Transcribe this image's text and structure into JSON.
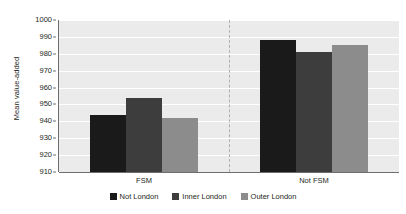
{
  "chart_data": {
    "type": "bar",
    "title": "",
    "subtitle": "",
    "xlabel": "",
    "ylabel": "Mean value-added",
    "categories": [
      "FSM",
      "Not FSM"
    ],
    "series": [
      {
        "name": "Not London",
        "color": "#1a1a1a",
        "values": [
          944,
          988
        ]
      },
      {
        "name": "Inner London",
        "color": "#3d3d3d",
        "values": [
          954,
          981
        ]
      },
      {
        "name": "Outer London",
        "color": "#8c8c8c",
        "values": [
          942,
          985
        ]
      }
    ],
    "ylim": [
      910,
      1000
    ],
    "ytick_step": 10,
    "ytick_labels": [
      "1000",
      "990",
      "980",
      "970",
      "960",
      "950",
      "940",
      "930",
      "920",
      "910"
    ],
    "ytick_values": [
      1000,
      990,
      980,
      970,
      960,
      950,
      940,
      930,
      920,
      910
    ],
    "grid": true,
    "grid_color": "#ffffff",
    "plot_background": "#ebebeb",
    "legend_position": "bottom",
    "group_divider": true,
    "annotations": []
  },
  "legend": {
    "items": [
      {
        "label": "Not London",
        "color": "#1a1a1a"
      },
      {
        "label": "Inner London",
        "color": "#3d3d3d"
      },
      {
        "label": "Outer London",
        "color": "#8c8c8c"
      }
    ]
  }
}
